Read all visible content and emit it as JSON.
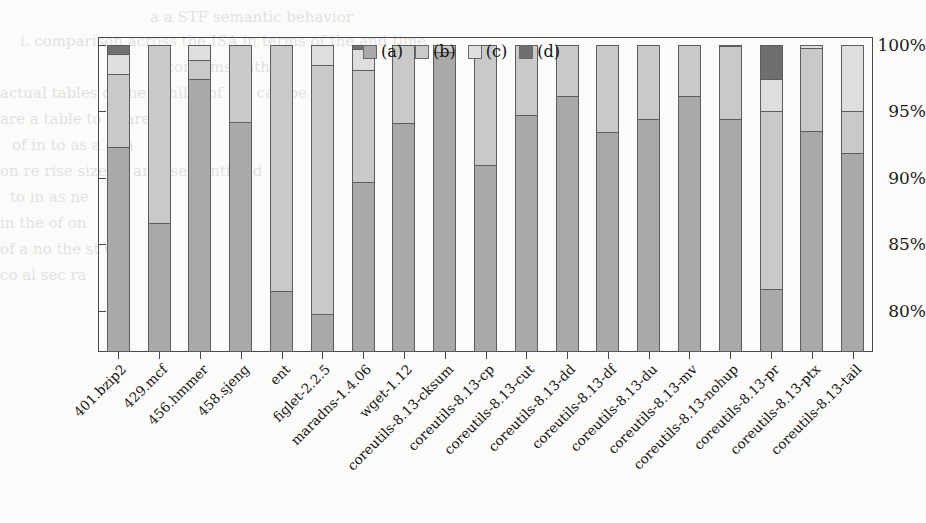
{
  "chart_data": {
    "type": "bar",
    "subtype": "stacked-bar-percentage",
    "title": "",
    "xlabel": "",
    "ylabel": "",
    "ylim": [
      76.9,
      100.6
    ],
    "grid": false,
    "legend_position": "top-right",
    "ytick_labels": [
      "100%",
      "95%",
      "90%",
      "85%",
      "80%"
    ],
    "ytick_values": [
      100,
      95,
      90,
      85,
      80
    ],
    "categories": [
      "401.bzip2",
      "429.mcf",
      "456.hmmer",
      "458.sjeng",
      "ent",
      "figlet-2.2.5",
      "maradns-1.4.06",
      "wget-1.12",
      "coreutils-8.13-cksum",
      "coreutils-8.13-cp",
      "coreutils-8.13-cut",
      "coreutils-8.13-dd",
      "coreutils-8.13-df",
      "coreutils-8.13-du",
      "coreutils-8.13-mv",
      "coreutils-8.13-nohup",
      "coreutils-8.13-pr",
      "coreutils-8.13-ptx",
      "coreutils-8.13-tail"
    ],
    "series": [
      {
        "name": "(a)",
        "color": "#a9a9a9",
        "values": [
          92.3,
          86.5,
          97.4,
          94.2,
          81.4,
          79.6,
          89.6,
          94.1,
          99.5,
          90.9,
          94.7,
          96.1,
          93.4,
          94.4,
          96.1,
          94.4,
          81.5,
          93.5,
          91.8
        ]
      },
      {
        "name": "(b)",
        "color": "#c9c9c9",
        "values": [
          5.5,
          13.5,
          1.5,
          5.8,
          18.6,
          18.9,
          8.5,
          5.9,
          0.5,
          9.1,
          5.3,
          3.9,
          6.6,
          5.6,
          3.9,
          5.5,
          13.5,
          6.3,
          3.2
        ]
      },
      {
        "name": "(c)",
        "color": "#dedede",
        "values": [
          1.5,
          0.0,
          1.1,
          0.0,
          0.0,
          1.5,
          1.6,
          0.0,
          0.0,
          0.0,
          0.0,
          0.0,
          0.0,
          0.0,
          0.0,
          0.0,
          2.4,
          0.2,
          5.0
        ]
      },
      {
        "name": "(d)",
        "color": "#6f6f6f",
        "values": [
          0.7,
          0.0,
          0.0,
          0.0,
          0.0,
          0.0,
          0.3,
          0.0,
          0.0,
          0.0,
          0.0,
          0.0,
          0.0,
          0.0,
          0.0,
          0.1,
          2.6,
          0.0,
          0.0
        ]
      }
    ]
  },
  "legend": {
    "items": [
      {
        "label": "(a)",
        "color": "#a9a9a9",
        "swatch_name": "legend-swatch-a"
      },
      {
        "label": "(b)",
        "color": "#c9c9c9",
        "swatch_name": "legend-swatch-b"
      },
      {
        "label": "(c)",
        "color": "#dedede",
        "swatch_name": "legend-swatch-c"
      },
      {
        "label": "(d)",
        "color": "#6f6f6f",
        "swatch_name": "legend-swatch-d"
      }
    ]
  },
  "background_text": {
    "lines": [
      "a   a    STF  semantic behavior",
      "i. comparison across the ISA in terms of the and time",
      "it confirms with",
      "actual tables of the exhibit of the  can be",
      "are  a     table to  in are",
      "of    in     to   as    a    of   a",
      "on re rise    size   se ano-   semantic ed",
      "to   in    as   ne",
      "in  the    of   on",
      "of a no     the    st   OU",
      "co   al    sec   ra"
    ]
  }
}
